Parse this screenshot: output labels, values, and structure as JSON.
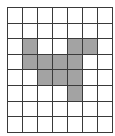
{
  "grid": {
    "rows": 8,
    "cols": 7,
    "fill_color": "#a3a3a3",
    "empty_color": "#ffffff",
    "line_color": "#3a3a3a",
    "filled_cells": [
      [
        2,
        1
      ],
      [
        2,
        4
      ],
      [
        2,
        5
      ],
      [
        3,
        1
      ],
      [
        3,
        2
      ],
      [
        3,
        3
      ],
      [
        3,
        4
      ],
      [
        4,
        2
      ],
      [
        4,
        3
      ],
      [
        4,
        4
      ],
      [
        5,
        4
      ]
    ]
  }
}
